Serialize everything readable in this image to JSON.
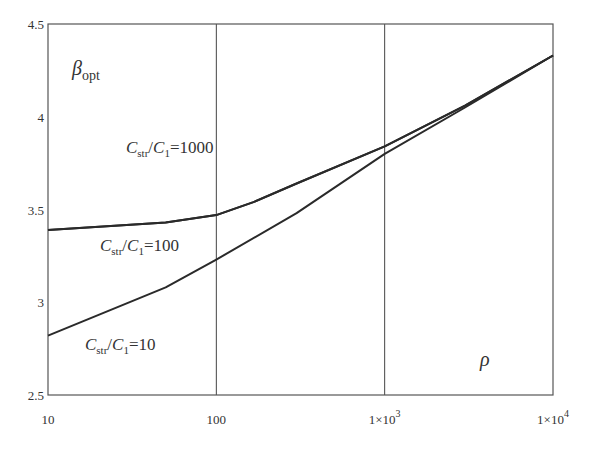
{
  "chart_data": {
    "type": "line",
    "title": "",
    "xlabel": "ρ",
    "ylabel": "β_opt",
    "ylabel_parts": {
      "main": "β",
      "sub": "opt"
    },
    "xscale": "log",
    "xlim": [
      10,
      10000
    ],
    "ylim": [
      2.5,
      4.5
    ],
    "grid": {
      "x": true,
      "y": false
    },
    "legend": "inline annotations",
    "x_ticks": [
      10,
      100,
      1000,
      10000
    ],
    "x_tick_labels": [
      {
        "base": "10",
        "exp": ""
      },
      {
        "base": "100",
        "exp": ""
      },
      {
        "base": "1×10",
        "exp": "3"
      },
      {
        "base": "1×10",
        "exp": "4"
      }
    ],
    "y_ticks": [
      2.5,
      3,
      3.5,
      4,
      4.5
    ],
    "y_tick_labels": [
      "2.5",
      "3",
      "3.5",
      "4",
      "4.5"
    ],
    "series": [
      {
        "name": "C_str/C_1=1000",
        "label_parts": {
          "c": "C",
          "sub1": "str",
          "slash": "/",
          "c2": "C",
          "sub2": "1",
          "eq": "=1000"
        },
        "x": [
          10,
          50,
          100,
          166,
          300,
          1000,
          3000,
          10000
        ],
        "values": [
          3.39,
          3.43,
          3.47,
          3.54,
          3.64,
          3.84,
          4.06,
          4.33
        ]
      },
      {
        "name": "C_str/C_1=100",
        "label_parts": {
          "c": "C",
          "sub1": "str",
          "slash": "/",
          "c2": "C",
          "sub2": "1",
          "eq": "=100"
        },
        "x": [
          10,
          50,
          100,
          166,
          300,
          1000,
          3000,
          10000
        ],
        "values": [
          3.39,
          3.43,
          3.47,
          3.54,
          3.64,
          3.84,
          4.06,
          4.33
        ]
      },
      {
        "name": "C_str/C_1=10",
        "label_parts": {
          "c": "C",
          "sub1": "str",
          "slash": "/",
          "c2": "C",
          "sub2": "1",
          "eq": "=10"
        },
        "x": [
          10,
          50,
          100,
          300,
          1000,
          3000,
          10000
        ],
        "values": [
          2.82,
          3.08,
          3.23,
          3.48,
          3.8,
          4.05,
          4.33
        ]
      }
    ],
    "annotations": [
      {
        "series": 0,
        "x_px": 126,
        "y_px": 153
      },
      {
        "series": 1,
        "x_px": 100,
        "y_px": 251
      },
      {
        "series": 2,
        "x_px": 85,
        "y_px": 350
      }
    ]
  },
  "colors": {
    "line": "#2a2a2a",
    "frame": "#555555",
    "text": "#333333",
    "background": "#ffffff"
  }
}
